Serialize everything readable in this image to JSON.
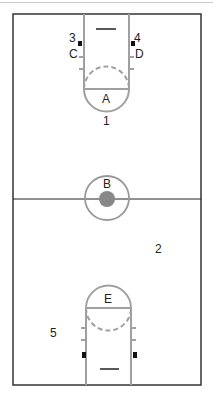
{
  "diagram": {
    "type": "basketball court positions",
    "colors": {
      "lines": "#333333",
      "lane": "#a0a0a0",
      "center_dot": "#888888",
      "background": "#ffffff"
    },
    "labels": {
      "A": "A",
      "B": "B",
      "C": "C",
      "D": "D",
      "E": "E",
      "p1": "1",
      "p2": "2",
      "p3": "3",
      "p4": "4",
      "p5": "5"
    }
  }
}
